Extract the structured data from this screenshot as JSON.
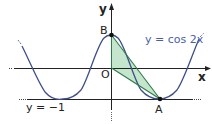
{
  "diagram": {
    "curve_label": "y = cos 2x",
    "line_label": "y = −1",
    "axis_x_label": "x",
    "axis_y_label": "y",
    "points": {
      "origin": "O",
      "A": "A",
      "B": "B"
    },
    "colors": {
      "curve": "#3d4f8a",
      "axis": "#222222",
      "fill": "#b9e2c3",
      "fill_edge": "#2f7a4a",
      "label_blue": "#4a5fa8"
    }
  }
}
